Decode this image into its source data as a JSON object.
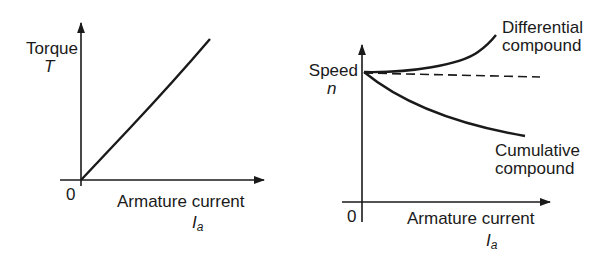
{
  "left_graph": {
    "y_label": "Torque",
    "y_symbol": "T",
    "origin_label": "0",
    "x_label": "Armature current",
    "x_symbol_main": "I",
    "x_symbol_sub": "a",
    "curve_description": "linear, through origin"
  },
  "right_graph": {
    "y_label": "Speed",
    "y_symbol": "n",
    "origin_label": "0",
    "x_label": "Armature current",
    "x_symbol_main": "I",
    "x_symbol_sub": "a",
    "curves": [
      {
        "label_line1": "Differential",
        "label_line2": "compound",
        "shape": "rising"
      },
      {
        "label_line1": "Cumulative",
        "label_line2": "compound",
        "shape": "falling"
      },
      {
        "label": "constant reference",
        "style": "dashed"
      }
    ]
  },
  "colors": {
    "ink": "#1a1a1a",
    "background": "#ffffff"
  }
}
